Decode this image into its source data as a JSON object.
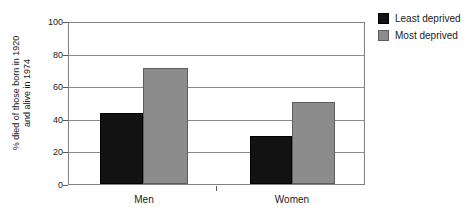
{
  "chart_data": {
    "type": "bar",
    "title": "",
    "xlabel": "",
    "ylabel_line1": "% died of those born in 1920",
    "ylabel_line2": "and alive in 1974",
    "categories": [
      "Men",
      "Women"
    ],
    "series": [
      {
        "name": "Least deprived",
        "color": "#121212",
        "values": [
          44,
          30
        ]
      },
      {
        "name": "Most deprived",
        "color": "#8c8c8c",
        "values": [
          72,
          51
        ]
      }
    ],
    "ylim": [
      0,
      100
    ],
    "yticks": [
      0,
      20,
      40,
      60,
      80,
      100
    ],
    "ytick_labels": [
      "0",
      "20",
      "40",
      "60",
      "80",
      "100"
    ],
    "grid": true,
    "legend_position": "right"
  },
  "legend": {
    "items": [
      {
        "label": "Least deprived"
      },
      {
        "label": "Most deprived"
      }
    ]
  }
}
